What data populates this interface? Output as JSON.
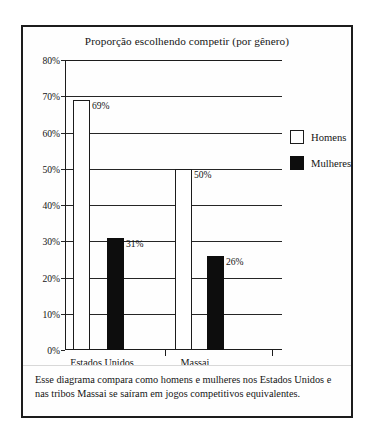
{
  "figure": {
    "caption": "Esse diagrama compara como homens e mulheres nos Estados Unidos e nas tribos Massai se saíram em jogos competitivos equivalentes."
  },
  "legend": {
    "items": [
      {
        "label": "Homens",
        "swatch": "white-square-outline",
        "color": "#ffffff"
      },
      {
        "label": "Mulheres",
        "swatch": "black-square-filled",
        "color": "#0d0d0d"
      }
    ]
  },
  "chart_data": {
    "type": "bar",
    "title": "Proporção escolhendo competir (por gênero)",
    "xlabel": "",
    "ylabel": "",
    "categories": [
      "Estados Unidos",
      "Massai"
    ],
    "series": [
      {
        "name": "Homens",
        "values": [
          69,
          50
        ],
        "color": "#ffffff"
      },
      {
        "name": "Mulheres",
        "values": [
          31,
          26
        ],
        "color": "#0d0d0d"
      }
    ],
    "data_labels": [
      {
        "series": "Homens",
        "category": "Estados Unidos",
        "text": "69%"
      },
      {
        "series": "Mulheres",
        "category": "Estados Unidos",
        "text": "31%"
      },
      {
        "series": "Homens",
        "category": "Massai",
        "text": "50%"
      },
      {
        "series": "Mulheres",
        "category": "Massai",
        "text": "26%"
      }
    ],
    "ylim": [
      0,
      80
    ],
    "ytick_values": [
      0,
      10,
      20,
      30,
      40,
      50,
      60,
      70,
      80
    ],
    "ytick_labels": [
      "0%",
      "10%",
      "20%",
      "30%",
      "40%",
      "50%",
      "60%",
      "70%",
      "80%"
    ],
    "grid": true,
    "grid_axis": "y",
    "legend_position": "right",
    "units": "percent"
  }
}
